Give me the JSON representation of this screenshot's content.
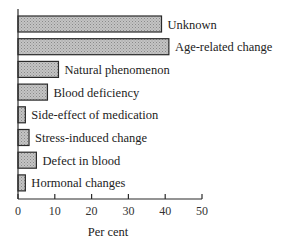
{
  "chart_data": {
    "type": "bar",
    "orientation": "horizontal",
    "title": "",
    "xlabel": "Per cent",
    "ylabel": "",
    "xlim": [
      0,
      50
    ],
    "xticks": [
      0,
      10,
      20,
      30,
      40,
      50
    ],
    "xtick_labels": [
      "0",
      "10",
      "20",
      "30",
      "40",
      "50"
    ],
    "grid": false,
    "legend": null,
    "label_placement": "right-of-bar",
    "categories": [
      "Unknown",
      "Age-related change",
      "Natural phenomenon",
      "Blood deficiency",
      "Side-effect of medication",
      "Stress-induced change",
      "Defect in blood",
      "Hormonal changes"
    ],
    "values": [
      39,
      41,
      11,
      8,
      2,
      3,
      5,
      2
    ],
    "bar_fill": "#bdbdbd",
    "bar_stroke": "#2a2a2a",
    "bar_pattern": "stippled"
  }
}
